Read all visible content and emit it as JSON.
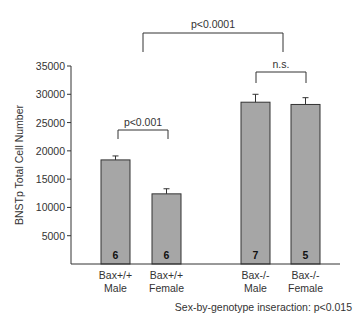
{
  "chart_data": {
    "type": "bar",
    "title": "",
    "xlabel": "",
    "ylabel": "BNSTp Total Cell Number",
    "ylim": [
      0,
      35000
    ],
    "yticks": [
      5000,
      10000,
      15000,
      20000,
      25000,
      30000,
      35000
    ],
    "grid": false,
    "legend": null,
    "categories": [
      {
        "line1": "Bax+/+",
        "line2": "Male"
      },
      {
        "line1": "Bax+/+",
        "line2": "Female"
      },
      {
        "line1": "Bax-/-",
        "line2": "Male"
      },
      {
        "line1": "Bax-/-",
        "line2": "Female"
      }
    ],
    "values": [
      18400,
      12400,
      28600,
      28200
    ],
    "error": [
      700,
      900,
      1400,
      1200
    ],
    "n": [
      "6",
      "6",
      "7",
      "5"
    ],
    "bar_color": "#a6a6a6",
    "annotations": {
      "top_bracket": "p<0.0001",
      "wt_bracket": "p<0.001",
      "ko_bracket": "n.s.",
      "footnote": "Sex-by-genotype inseraction: p<0.015"
    }
  }
}
